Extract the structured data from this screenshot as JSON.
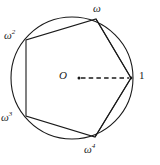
{
  "figure": {
    "colors": {
      "stroke": "#1a1a1a",
      "background": "#ffffff",
      "label": "#1a1a1a"
    },
    "circle": {
      "center_x": 72,
      "center_y": 78,
      "radius": 61
    },
    "center_point": {
      "label": "O",
      "dot_x": 79,
      "dot_y": 78
    },
    "vertices": [
      {
        "id": "one",
        "label": "1",
        "sup": "",
        "x": 131,
        "y": 78,
        "label_x": 139,
        "label_y": 70
      },
      {
        "id": "omega",
        "label": "ω",
        "sup": "",
        "x": 96,
        "y": 19,
        "label_x": 93,
        "label_y": 3
      },
      {
        "id": "omega2",
        "label": "ω",
        "sup": "2",
        "x": 26,
        "y": 40,
        "label_x": 4,
        "label_y": 30
      },
      {
        "id": "omega3",
        "label": "ω",
        "sup": "3",
        "x": 26,
        "y": 116,
        "label_x": 1,
        "label_y": 112
      },
      {
        "id": "omega4",
        "label": "ω",
        "sup": "4",
        "x": 95,
        "y": 137,
        "label_x": 84,
        "label_y": 144
      }
    ],
    "pentagon_edges": [
      {
        "from": "one",
        "to": "omega"
      },
      {
        "from": "omega",
        "to": "omega2"
      },
      {
        "from": "omega2",
        "to": "omega3"
      },
      {
        "from": "omega3",
        "to": "omega4"
      },
      {
        "from": "omega4",
        "to": "one"
      }
    ],
    "chords": [
      {
        "from": "one",
        "to": "omega",
        "style": "solid"
      },
      {
        "from": "one",
        "to": "omega4",
        "style": "solid"
      }
    ],
    "radius_line": {
      "from": "O",
      "to": "1",
      "style": "dashed",
      "x1": 81,
      "y1": 78,
      "x2": 129,
      "y2": 78
    }
  }
}
